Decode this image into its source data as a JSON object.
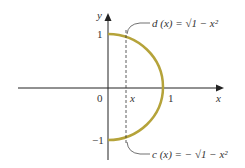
{
  "diagram": {
    "type": "semicircle-region",
    "axes": {
      "x_label": "x",
      "y_label": "y",
      "origin_label": "0",
      "x_tick_one": "1",
      "y_tick_one": "1",
      "y_tick_neg_one": "−1"
    },
    "dashed_line_label": "x",
    "upper_curve": {
      "name": "d (x)",
      "equals": "=",
      "expression": "√1 − x²",
      "full_label": "d (x) = √1 − x²"
    },
    "lower_curve": {
      "name": "c (x)",
      "equals": "=",
      "expression": "− √1 − x²",
      "full_label": "c (x) = − √1 − x²"
    },
    "colors": {
      "curve": "#b5a33a",
      "axis": "#222222",
      "text": "#333333"
    }
  }
}
